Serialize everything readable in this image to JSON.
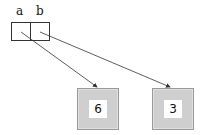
{
  "variables": [
    {
      "name": "a",
      "points_to": 0
    },
    {
      "name": "b",
      "points_to": 1
    }
  ],
  "objects": [
    {
      "value": "6"
    },
    {
      "value": "3"
    }
  ],
  "colors": {
    "object_fill": "#cfcfcf",
    "object_border": "#999999",
    "line": "#333333"
  }
}
